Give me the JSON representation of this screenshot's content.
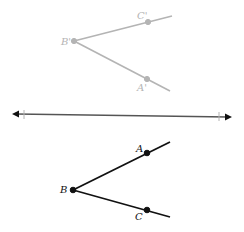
{
  "figure": {
    "image_angle": {
      "vertex_label": "B'",
      "upper_label": "C'",
      "lower_label": "A'",
      "color": "#b4b4b4"
    },
    "reflection_line": {
      "color": "#444444"
    },
    "original_angle": {
      "vertex_label": "B",
      "upper_label": "A",
      "lower_label": "C",
      "color": "#111111"
    }
  }
}
